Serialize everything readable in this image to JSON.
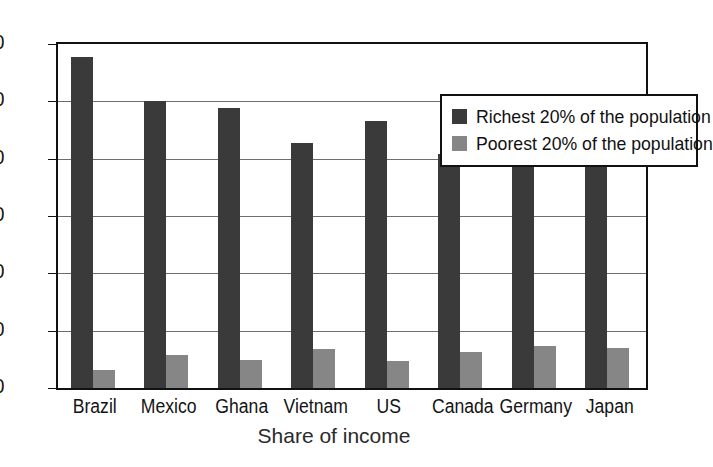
{
  "chart_data": {
    "type": "bar",
    "title": "",
    "xlabel": "Share of income",
    "ylabel": "",
    "ylim": [
      0,
      60
    ],
    "yticks": [
      0,
      10,
      20,
      30,
      40,
      50,
      60
    ],
    "grid": true,
    "legend_position": "top-right",
    "categories": [
      "Brazil",
      "Mexico",
      "Ghana",
      "Vietnam",
      "US",
      "Canada",
      "Germany",
      "Japan"
    ],
    "series": [
      {
        "name": "Richest 20% of the population",
        "color": "#3a3a3a",
        "values": [
          57.8,
          50.0,
          48.8,
          42.7,
          46.5,
          40.8,
          39.5,
          39.4
        ]
      },
      {
        "name": "Poorest 20% of the population",
        "color": "#868686",
        "values": [
          3.1,
          5.8,
          4.8,
          6.8,
          4.7,
          6.2,
          7.3,
          6.9
        ]
      }
    ]
  },
  "axis": {
    "x_title": "Share of income",
    "y_tick_labels": [
      "0",
      "10",
      "20",
      "30",
      "40",
      "50",
      "60"
    ]
  },
  "legend": {
    "entries": [
      {
        "label": "Richest 20% of the population",
        "swatch": "#3a3a3a"
      },
      {
        "label": "Poorest 20% of the population",
        "swatch": "#868686"
      }
    ]
  },
  "colors": {
    "rich": "#3a3a3a",
    "poor": "#868686",
    "axis": "#111111",
    "grid": "#6e6e6e",
    "background": "#ffffff"
  }
}
